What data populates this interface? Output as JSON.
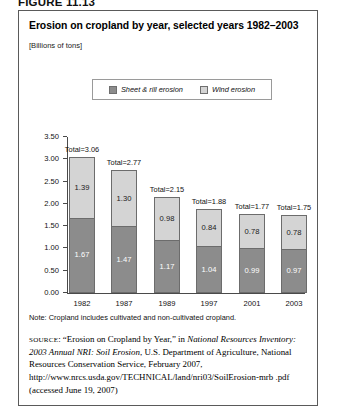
{
  "figure_label": "FIGURE 11.13",
  "panel": {
    "title": "Erosion on cropland by year, selected years 1982–2003",
    "units": "[Billions of tons]"
  },
  "legend": {
    "entries": [
      {
        "label": "Sheet & rill erosion",
        "swatch": "#8c8c8c",
        "icon": "legend-swatch-sheet-rill"
      },
      {
        "label": "Wind erosion",
        "swatch": "#d4d4d4",
        "icon": "legend-swatch-wind"
      }
    ]
  },
  "note": "Note: Cropland includes cultivated and non-cultivated cropland.",
  "source": {
    "tag": "SOURCE",
    "text_1": ": “Erosion on Cropland by Year,” in ",
    "italic_1": "National Resources Inventory: 2003 Annual NRI: Soil Erosion",
    "text_2": ", U.S. Department of Agriculture, National Resources Conservation Service, February 2007, http://www.nrcs.usda.gov/TECHNICAL/land/nri03/SoilErosion-mrb .pdf (accessed June 19, 2007)"
  },
  "chart_data": {
    "type": "bar",
    "title": "Erosion on cropland by year, selected years 1982–2003",
    "subtitle": "[Billions of tons]",
    "stacked": true,
    "xlabel": "",
    "ylabel": "",
    "ylim": [
      0.0,
      3.5
    ],
    "yticks": [
      "0.00",
      "0.50",
      "1.00",
      "1.50",
      "2.00",
      "2.50",
      "3.00",
      "3.50"
    ],
    "ytick_values": [
      0.0,
      0.5,
      1.0,
      1.5,
      2.0,
      2.5,
      3.0,
      3.5
    ],
    "grid": false,
    "legend_position": "top-center",
    "categories": [
      "1982",
      "1987",
      "1989",
      "1997",
      "2001",
      "2003"
    ],
    "series": [
      {
        "name": "Sheet & rill erosion",
        "color": "#8c8c8c",
        "values": [
          1.67,
          1.47,
          1.17,
          1.04,
          0.99,
          0.97
        ]
      },
      {
        "name": "Wind erosion",
        "color": "#d4d4d4",
        "values": [
          1.39,
          1.3,
          0.98,
          0.84,
          0.78,
          0.78
        ]
      }
    ],
    "totals": [
      3.06,
      2.77,
      2.15,
      1.88,
      1.77,
      1.75
    ],
    "total_labels": [
      "Total=3.06",
      "Total=2.77",
      "Total=2.15",
      "Total=1.88",
      "Total=1.77",
      "Total=1.75"
    ],
    "sheet_labels": [
      "1.67",
      "1.47",
      "1.17",
      "1.04",
      "0.99",
      "0.97"
    ],
    "wind_labels": [
      "1.39",
      "1.30",
      "0.98",
      "0.84",
      "0.78",
      "0.78"
    ]
  }
}
